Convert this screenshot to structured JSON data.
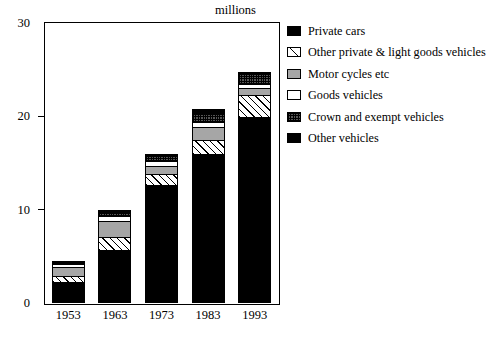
{
  "chart_data": {
    "type": "bar",
    "title": "",
    "subtitle": "",
    "units_label": "millions",
    "xlabel": "",
    "ylabel": "",
    "ylim": [
      0,
      30
    ],
    "yticks": [
      0,
      10,
      20,
      30
    ],
    "ytick_labels": [
      "0",
      "10",
      "20",
      "30"
    ],
    "grid": false,
    "stacked": true,
    "legend_position": "right",
    "categories": [
      "1953",
      "1963",
      "1973",
      "1983",
      "1993"
    ],
    "series": [
      {
        "name": "Private cars",
        "swatch": "solid-black",
        "values": [
          2.2,
          5.6,
          12.6,
          15.9,
          19.9
        ]
      },
      {
        "name": "Other private & light goods vehicles",
        "swatch": "diagonal-hatch",
        "values": [
          0.7,
          1.4,
          1.2,
          1.6,
          2.4
        ]
      },
      {
        "name": "Motor cycles etc",
        "swatch": "gray",
        "values": [
          0.9,
          1.8,
          0.9,
          1.4,
          0.7
        ]
      },
      {
        "name": "Goods vehicles",
        "swatch": "white",
        "values": [
          0.4,
          0.5,
          0.5,
          0.5,
          0.5
        ]
      },
      {
        "name": "Crown and exempt vehicles",
        "swatch": "checkered",
        "values": [
          0.2,
          0.3,
          0.5,
          1.0,
          1.0
        ]
      },
      {
        "name": "Other vehicles",
        "swatch": "solid-black",
        "values": [
          0.1,
          0.4,
          0.3,
          0.4,
          0.3
        ]
      }
    ],
    "totals": [
      4.5,
      10.0,
      16.0,
      20.8,
      24.8
    ]
  },
  "legend": {
    "items": [
      {
        "label": "Private cars",
        "swatch": "solid-black"
      },
      {
        "label": "Other private & light goods vehicles",
        "swatch": "diagonal-hatch"
      },
      {
        "label": "Motor cycles etc",
        "swatch": "gray"
      },
      {
        "label": "Goods vehicles",
        "swatch": "white"
      },
      {
        "label": "Crown and exempt vehicles",
        "swatch": "checkered"
      },
      {
        "label": "Other vehicles",
        "swatch": "solid-black"
      }
    ]
  },
  "colors": {
    "ink": "#000000",
    "background": "#ffffff",
    "gray_fill": "#a6a6a6",
    "checker_fill": "#555555"
  }
}
